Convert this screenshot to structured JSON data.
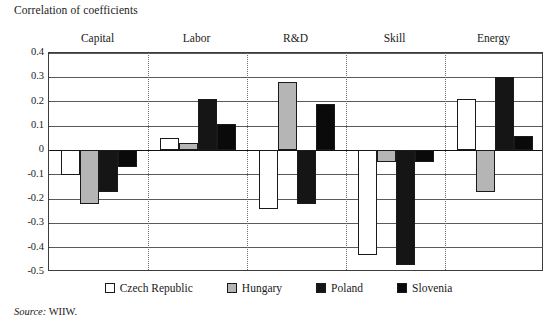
{
  "chart_data": {
    "type": "bar",
    "title": "Correlation of coefficients",
    "xlabel": "",
    "ylabel": "",
    "ylim": [
      -0.5,
      0.4
    ],
    "ytick_labels": [
      "0.4",
      "0.3",
      "0.2",
      "0.1",
      "0",
      "-0.1",
      "-0.2",
      "-0.3",
      "-0.4",
      "-0.5"
    ],
    "ytick_values": [
      0.4,
      0.3,
      0.2,
      0.1,
      0,
      -0.1,
      -0.2,
      -0.3,
      -0.4,
      -0.5
    ],
    "grid": true,
    "legend_position": "bottom",
    "categories": [
      "Capital",
      "Labor",
      "R&D",
      "Skill",
      "Energy"
    ],
    "series": [
      {
        "name": "Czech Republic",
        "color": "#ffffff",
        "values": [
          -0.1,
          0.05,
          -0.24,
          -0.43,
          0.21
        ]
      },
      {
        "name": "Hungary",
        "color": "#b5b5b5",
        "values": [
          -0.22,
          0.03,
          0.28,
          -0.05,
          -0.17
        ]
      },
      {
        "name": "Poland",
        "color": "#151515",
        "values": [
          -0.17,
          0.21,
          -0.22,
          -0.47,
          0.3
        ]
      },
      {
        "name": "Slovenia",
        "color": "#0a0a0a",
        "values": [
          -0.07,
          0.11,
          0.19,
          -0.05,
          0.06
        ]
      }
    ]
  },
  "source": {
    "prefix": "Source:",
    "text": "WIIW."
  }
}
